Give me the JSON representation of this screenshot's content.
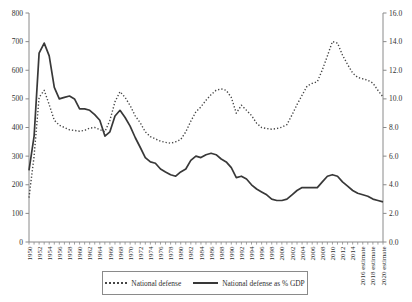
{
  "chart_data": {
    "type": "line",
    "title": "",
    "xlabel": "",
    "ylabel_left": "",
    "ylabel_right": "",
    "grid": false,
    "legend_position": "bottom-center",
    "years": [
      1950,
      1951,
      1952,
      1953,
      1954,
      1955,
      1956,
      1957,
      1958,
      1959,
      1960,
      1961,
      1962,
      1963,
      1964,
      1965,
      1966,
      1967,
      1968,
      1969,
      1970,
      1971,
      1972,
      1973,
      1974,
      1975,
      1976,
      1977,
      1978,
      1979,
      1980,
      1981,
      1982,
      1983,
      1984,
      1985,
      1986,
      1987,
      1988,
      1989,
      1990,
      1991,
      1992,
      1993,
      1994,
      1995,
      1996,
      1997,
      1998,
      1999,
      2000,
      2001,
      2002,
      2003,
      2004,
      2005,
      2006,
      2007,
      2008,
      2009,
      2010,
      2011,
      2012,
      2013,
      2014,
      2015,
      2016,
      2017,
      2018,
      2019,
      2020
    ],
    "series": [
      {
        "name": "National defense",
        "axis": "left",
        "style": "dotted",
        "color": "#464646",
        "values": [
          155,
          300,
          505,
          530,
          480,
          425,
          408,
          400,
          392,
          390,
          387,
          390,
          398,
          400,
          393,
          385,
          425,
          490,
          525,
          505,
          477,
          441,
          416,
          385,
          368,
          360,
          352,
          348,
          345,
          350,
          358,
          385,
          422,
          455,
          472,
          495,
          515,
          530,
          535,
          530,
          505,
          450,
          478,
          460,
          442,
          415,
          400,
          396,
          394,
          396,
          401,
          410,
          444,
          480,
          513,
          545,
          554,
          560,
          601,
          650,
          700,
          695,
          653,
          620,
          590,
          575,
          570,
          565,
          555,
          530,
          507
        ]
      },
      {
        "name": "National defense as % GDP",
        "axis": "right",
        "style": "solid",
        "color": "#383838",
        "values": [
          5.0,
          7.4,
          13.2,
          13.9,
          13.0,
          10.8,
          10.0,
          10.1,
          10.2,
          10.0,
          9.3,
          9.3,
          9.2,
          8.9,
          8.5,
          7.4,
          7.7,
          8.8,
          9.2,
          8.7,
          8.1,
          7.3,
          6.6,
          5.9,
          5.6,
          5.5,
          5.1,
          4.9,
          4.7,
          4.6,
          4.9,
          5.1,
          5.7,
          6.0,
          5.9,
          6.1,
          6.2,
          6.1,
          5.8,
          5.6,
          5.2,
          4.5,
          4.6,
          4.4,
          4.0,
          3.7,
          3.5,
          3.3,
          3.0,
          2.9,
          2.9,
          3.0,
          3.3,
          3.6,
          3.8,
          3.8,
          3.8,
          3.8,
          4.2,
          4.6,
          4.7,
          4.6,
          4.2,
          3.9,
          3.6,
          3.4,
          3.3,
          3.2,
          3.0,
          2.9,
          2.8
        ]
      }
    ],
    "left_axis": {
      "min": 0,
      "max": 800,
      "step": 100,
      "decimals": 0
    },
    "right_axis": {
      "min": 0,
      "max": 16,
      "step": 2,
      "decimals": 1
    },
    "x_axis": {
      "start": 1950,
      "end": 2020,
      "tick_every_years": 1,
      "label_every_years": 2,
      "estimate_years": [
        2016,
        2018,
        2020
      ],
      "estimate_suffix": " estimate"
    }
  }
}
